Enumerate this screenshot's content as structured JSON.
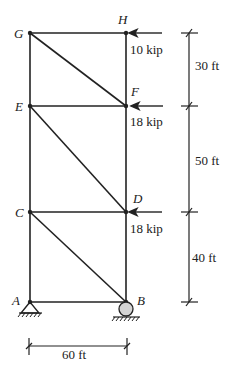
{
  "diagram": {
    "type": "truss",
    "nodes": [
      {
        "id": "G",
        "label": "G"
      },
      {
        "id": "H",
        "label": "H"
      },
      {
        "id": "E",
        "label": "E"
      },
      {
        "id": "F",
        "label": "F"
      },
      {
        "id": "C",
        "label": "C"
      },
      {
        "id": "D",
        "label": "D"
      },
      {
        "id": "A",
        "label": "A"
      },
      {
        "id": "B",
        "label": "B"
      }
    ],
    "loads": [
      {
        "node": "H",
        "label": "10 kip"
      },
      {
        "node": "F",
        "label": "18 kip"
      },
      {
        "node": "D",
        "label": "18 kip"
      }
    ],
    "dimensions": {
      "vertical": [
        "30 ft",
        "50 ft",
        "40 ft"
      ],
      "horizontal": "60 ft"
    },
    "supports": {
      "A": "pin",
      "B": "roller"
    }
  }
}
